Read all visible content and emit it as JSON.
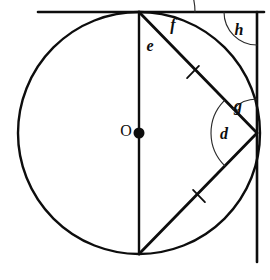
{
  "figure": {
    "background_color": "#ffffff",
    "line_color": "#0d0d0d",
    "arc_color": "#2b2b2b",
    "width": 270,
    "height": 280
  },
  "circle": {
    "center_label": "O",
    "center_x": 139,
    "center_y": 133,
    "radius": 121,
    "stroke_width": 2.4
  },
  "points": {
    "top": {
      "name": "top-vertex",
      "x": 139,
      "y": 12
    },
    "bottom": {
      "name": "bottom-vertex",
      "x": 139,
      "y": 254
    },
    "right": {
      "name": "right-vertex",
      "x": 257,
      "y": 133
    },
    "corner": {
      "name": "top-right-corner",
      "x": 257,
      "y": 12
    }
  },
  "lines": {
    "horizontal_tangent": {
      "x1": 38,
      "y1": 12,
      "x2": 264,
      "y2": 12,
      "stroke_width": 2.6
    },
    "vertical_right": {
      "x1": 257,
      "y1": 12,
      "x2": 257,
      "y2": 262,
      "stroke_width": 2.6
    },
    "vertical_diameter": {
      "x1": 139,
      "y1": 12,
      "x2": 139,
      "y2": 254,
      "stroke_width": 2.4
    },
    "chord_upper": {
      "x1": 139,
      "y1": 12,
      "x2": 257,
      "y2": 133,
      "stroke_width": 2.8
    },
    "chord_lower": {
      "x1": 139,
      "y1": 254,
      "x2": 257,
      "y2": 133,
      "stroke_width": 2.8
    }
  },
  "tick_marks": [
    {
      "name": "tick-upper-chord",
      "cx": 193,
      "cy": 72,
      "angle": 45.7,
      "length": 17
    },
    {
      "name": "tick-lower-chord",
      "cx": 199,
      "cy": 196,
      "angle": -45.7,
      "length": 17
    }
  ],
  "angles": [
    {
      "id": "e",
      "label": "e",
      "vertex": "top-vertex",
      "description": "angle between vertical diameter and upper chord at top vertex",
      "label_x": 150,
      "label_y": 47,
      "radius": 38,
      "start_deg": 90,
      "end_deg": 45.7,
      "font_size": 16
    },
    {
      "id": "f",
      "label": "f",
      "vertex": "top-vertex",
      "description": "angle between upper chord and horizontal tangent at top vertex",
      "label_x": 173,
      "label_y": 26,
      "radius": 56,
      "start_deg": 45.7,
      "end_deg": 0,
      "font_size": 16
    },
    {
      "id": "g",
      "label": "g",
      "vertex": "right-vertex",
      "description": "angle between upper chord and vertical line above right vertex",
      "label_x": 238,
      "label_y": 107,
      "radius": 34,
      "start_deg": 135.7,
      "end_deg": 90,
      "font_size": 16
    },
    {
      "id": "d",
      "label": "d",
      "vertex": "right-vertex",
      "description": "angle between upper chord and lower chord at right vertex",
      "label_x": 224,
      "label_y": 135,
      "radius": 46,
      "start_deg": 225.7,
      "end_deg": 135.7,
      "font_size": 16
    },
    {
      "id": "h",
      "label": "h",
      "vertex": "top-right-corner",
      "description": "right angle between horizontal tangent and vertical line at corner",
      "label_x": 239,
      "label_y": 31,
      "radius": 33,
      "start_deg": 180,
      "end_deg": 270,
      "font_size": 16
    }
  ],
  "labels": {
    "center": {
      "text": "O",
      "x": 126,
      "y": 132,
      "font_size": 16
    }
  }
}
